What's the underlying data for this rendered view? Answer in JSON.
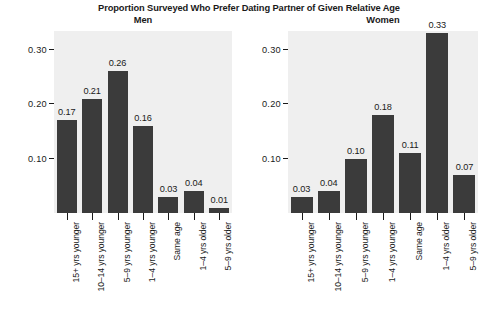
{
  "chart_data": {
    "type": "bar",
    "title": "Proportion Surveyed Who Prefer Dating Partner of Given Relative Age",
    "xlabel": "",
    "ylabel": "",
    "ylim": [
      0,
      0.35
    ],
    "yticks": [
      "0.10",
      "0.20",
      "0.30"
    ],
    "ytick_values": [
      0.1,
      0.2,
      0.3
    ],
    "grid": false,
    "legend": "none",
    "categories": [
      "15+ yrs younger",
      "10–14 yrs younger",
      "5–9 yrs younger",
      "1–4 yrs younger",
      "Same age",
      "1–4 yrs older",
      "5–9 yrs older"
    ],
    "panels": [
      {
        "name": "Men",
        "values": [
          0.17,
          0.21,
          0.26,
          0.16,
          0.03,
          0.04,
          0.01
        ],
        "labels": [
          "0.17",
          "0.21",
          "0.26",
          "0.16",
          "0.03",
          "0.04",
          "0.01"
        ]
      },
      {
        "name": "Women",
        "values": [
          0.03,
          0.04,
          0.1,
          0.18,
          0.11,
          0.33,
          0.07
        ],
        "labels": [
          "0.03",
          "0.04",
          "0.10",
          "0.18",
          "0.11",
          "0.33",
          "0.07"
        ]
      }
    ],
    "colors": {
      "bar": "#3b3b3b",
      "panel_background": "#efefef",
      "figure_background": "#ffffff",
      "text": "#1a1a1a"
    }
  }
}
